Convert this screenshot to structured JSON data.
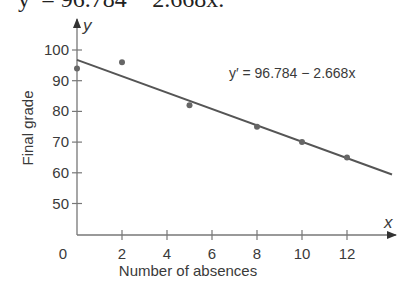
{
  "header": {
    "equation_text": "y′ = 96.784 − 2.668x."
  },
  "chart_data": {
    "type": "scatter",
    "title": "",
    "xlabel": "Number of absences",
    "ylabel": "Final grade",
    "x_axis_var": "x",
    "y_axis_var": "y",
    "xlim": [
      0,
      14
    ],
    "ylim": [
      40,
      105
    ],
    "x_ticks": [
      2,
      4,
      6,
      8,
      10,
      12
    ],
    "x_tick_labels": [
      "2",
      "4",
      "6",
      "8",
      "10",
      "12"
    ],
    "origin_label": "0",
    "y_ticks": [
      50,
      60,
      70,
      80,
      90,
      100
    ],
    "y_tick_labels": [
      "50",
      "60",
      "70",
      "80",
      "90",
      "100"
    ],
    "grid": false,
    "legend": null,
    "series": [
      {
        "name": "Observed data",
        "type": "scatter",
        "x": [
          0,
          2,
          5,
          8,
          10,
          12
        ],
        "y": [
          94,
          96,
          82,
          75,
          70,
          65
        ]
      },
      {
        "name": "Regression line",
        "type": "line",
        "intercept": 96.784,
        "slope": -2.668,
        "x_range": [
          0,
          14
        ]
      }
    ],
    "annotations": [
      {
        "text": "y′ = 96.784 − 2.668x",
        "x": 6.8,
        "y": 93
      }
    ],
    "colors": {
      "line": "#555555",
      "points": "#666666",
      "axis": "#777777",
      "text": "#3a3a3a"
    }
  }
}
